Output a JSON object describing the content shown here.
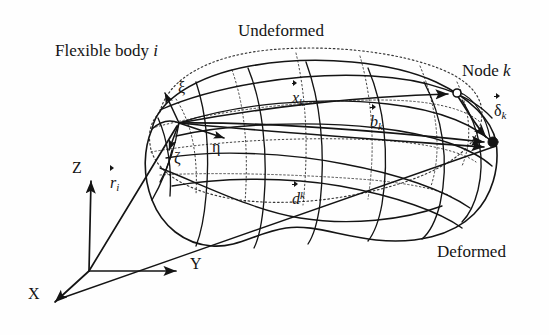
{
  "figure": {
    "type": "technical-diagram",
    "background_color": "#fefefe",
    "line_color": "#141414"
  },
  "labels": {
    "flexible_body": "Flexible body",
    "flexible_body_index": "i",
    "undeformed": "Undeformed",
    "deformed": "Deformed",
    "node": "Node",
    "node_index": "k"
  },
  "global_frame": {
    "name": "global-coordinate-system",
    "origin": [
      89,
      271
    ],
    "axes": [
      {
        "label": "Z",
        "tip": [
          91,
          177
        ],
        "label_pos": [
          72,
          160
        ]
      },
      {
        "label": "Y",
        "tip": [
          181,
          271
        ],
        "label_pos": [
          190,
          256
        ]
      },
      {
        "label": "X",
        "tip": [
          51,
          306
        ],
        "label_pos": [
          28,
          286
        ]
      }
    ]
  },
  "body_frame": {
    "name": "body-local-frame",
    "origin": [
      179,
      123
    ],
    "axes": [
      {
        "label": "ξ",
        "tip": [
          163,
          89
        ],
        "label_pos": [
          178,
          80
        ]
      },
      {
        "label": "η",
        "tip": [
          230,
          140
        ],
        "label_pos": [
          212,
          139
        ]
      },
      {
        "label": "ζ",
        "tip": [
          167,
          154
        ],
        "label_pos": [
          174,
          150
        ]
      }
    ]
  },
  "vectors": [
    {
      "symbol": "r",
      "sub": "i",
      "sup": "",
      "label_pos": [
        110,
        175
      ],
      "from": [
        89,
        271
      ],
      "to": [
        179,
        123
      ],
      "name": "vector-r-i",
      "meaning": "position of body reference frame in global frame"
    },
    {
      "symbol": "x",
      "sub": "k",
      "sup": "",
      "label_pos": [
        292,
        90
      ],
      "from": [
        179,
        123
      ],
      "to": [
        452,
        94
      ],
      "name": "vector-x-k",
      "meaning": "undeformed position of node k in body frame"
    },
    {
      "symbol": "b",
      "sub": "k",
      "sup": "",
      "label_pos": [
        370,
        114
      ],
      "from": [
        179,
        123
      ],
      "to": [
        489,
        143
      ],
      "name": "vector-b-k",
      "meaning": "deformed position of node k in body frame"
    },
    {
      "symbol": "d",
      "sub": "",
      "sup": "k",
      "label_pos": [
        292,
        190
      ],
      "from": [
        179,
        123
      ],
      "to": [
        489,
        147
      ],
      "name": "vector-d-k",
      "meaning": "lower connector vector to deformed node k"
    },
    {
      "symbol": "δ",
      "sub": "k",
      "sup": "",
      "label_pos": [
        494,
        103
      ],
      "from": [
        457,
        93
      ],
      "to": [
        491,
        140
      ],
      "name": "vector-delta-k",
      "meaning": "elastic displacement of node k"
    }
  ],
  "nodes": [
    {
      "name": "node-k-undeformed",
      "style": "open-circle",
      "pos": [
        457,
        93
      ],
      "r": 4.0
    },
    {
      "name": "node-k-deformed",
      "style": "filled-dot",
      "pos": [
        493,
        142
      ],
      "r": 5.0
    }
  ],
  "callout_positions": {
    "flexible_body": [
      55,
      42
    ],
    "undeformed": [
      238,
      22
    ],
    "node_k": [
      462,
      62
    ],
    "deformed": [
      437,
      243
    ]
  }
}
